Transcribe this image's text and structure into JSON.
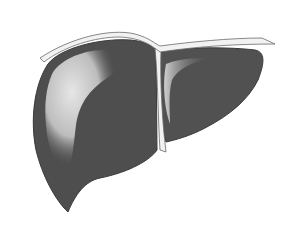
{
  "image": {
    "subject": "liver illustration",
    "width": 293,
    "height": 238,
    "colors": {
      "background": "#ffffff",
      "lobe_dark": "#4a4a4a",
      "lobe_mid": "#5a5a5a",
      "highlight": "#d8d8d8",
      "ligament": "#f2f2f2",
      "outline": "#6a6a6a"
    },
    "parts": [
      {
        "id": "right-lobe",
        "label": "Right lobe"
      },
      {
        "id": "left-lobe",
        "label": "Left lobe"
      },
      {
        "id": "falciform-ligament",
        "label": "Falciform ligament"
      },
      {
        "id": "coronary-ligament",
        "label": "Coronary ligament"
      }
    ]
  }
}
